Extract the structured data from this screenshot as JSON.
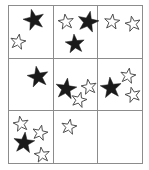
{
  "figure": {
    "grid": {
      "rows": 3,
      "columns": 3,
      "x": 8,
      "y": 5,
      "width": 134,
      "height": 158,
      "line_color": "#8c8c8c",
      "background_color": "#ffffff"
    },
    "star_styles": {
      "filled": {
        "name": "filled-star",
        "fill": "#1a1a1a",
        "stroke": "#1a1a1a"
      },
      "outline": {
        "name": "outline-star",
        "fill": "#ffffff",
        "stroke": "#4d4d4d"
      }
    },
    "cells": [
      {
        "row": 0,
        "col": 0,
        "name": "cell-r0-c0",
        "counts": {
          "filled": 1,
          "outline": 1,
          "total": 2
        },
        "stars": [
          {
            "type": "filled",
            "cx": 34,
            "cy": 20,
            "r": 11,
            "rot": -14
          },
          {
            "type": "outline",
            "cx": 18,
            "cy": 42,
            "r": 8,
            "rot": 10
          }
        ]
      },
      {
        "row": 0,
        "col": 1,
        "name": "cell-r0-c1",
        "counts": {
          "filled": 2,
          "outline": 1,
          "total": 3
        },
        "stars": [
          {
            "type": "outline",
            "cx": 66,
            "cy": 22,
            "r": 8,
            "rot": -8
          },
          {
            "type": "filled",
            "cx": 88,
            "cy": 22,
            "r": 11,
            "rot": 12
          },
          {
            "type": "filled",
            "cx": 75,
            "cy": 44,
            "r": 10,
            "rot": -6
          }
        ]
      },
      {
        "row": 0,
        "col": 2,
        "name": "cell-r0-c2",
        "counts": {
          "filled": 0,
          "outline": 2,
          "total": 2
        },
        "stars": [
          {
            "type": "outline",
            "cx": 112,
            "cy": 22,
            "r": 8,
            "rot": 6
          },
          {
            "type": "outline",
            "cx": 133,
            "cy": 24,
            "r": 8,
            "rot": -12
          }
        ]
      },
      {
        "row": 1,
        "col": 0,
        "name": "cell-r1-c0",
        "counts": {
          "filled": 1,
          "outline": 0,
          "total": 1
        },
        "stars": [
          {
            "type": "filled",
            "cx": 38,
            "cy": 77,
            "r": 11,
            "rot": -10
          }
        ]
      },
      {
        "row": 1,
        "col": 1,
        "name": "cell-r1-c1",
        "counts": {
          "filled": 1,
          "outline": 2,
          "total": 3
        },
        "stars": [
          {
            "type": "filled",
            "cx": 66,
            "cy": 89,
            "r": 11,
            "rot": 8
          },
          {
            "type": "outline",
            "cx": 89,
            "cy": 87,
            "r": 8,
            "rot": -10
          },
          {
            "type": "outline",
            "cx": 79,
            "cy": 100,
            "r": 8,
            "rot": 14
          }
        ]
      },
      {
        "row": 1,
        "col": 2,
        "name": "cell-r1-c2",
        "counts": {
          "filled": 1,
          "outline": 2,
          "total": 3
        },
        "stars": [
          {
            "type": "filled",
            "cx": 111,
            "cy": 88,
            "r": 11,
            "rot": -6
          },
          {
            "type": "outline",
            "cx": 128,
            "cy": 76,
            "r": 8,
            "rot": 10
          },
          {
            "type": "outline",
            "cx": 133,
            "cy": 95,
            "r": 8,
            "rot": -14
          }
        ]
      },
      {
        "row": 2,
        "col": 0,
        "name": "cell-r2-c0",
        "counts": {
          "filled": 1,
          "outline": 3,
          "total": 4
        },
        "stars": [
          {
            "type": "outline",
            "cx": 21,
            "cy": 124,
            "r": 8,
            "rot": -10
          },
          {
            "type": "outline",
            "cx": 40,
            "cy": 133,
            "r": 8,
            "rot": 12
          },
          {
            "type": "filled",
            "cx": 24,
            "cy": 143,
            "r": 11,
            "rot": 6
          },
          {
            "type": "outline",
            "cx": 42,
            "cy": 155,
            "r": 8,
            "rot": -8
          }
        ]
      },
      {
        "row": 2,
        "col": 1,
        "name": "cell-r2-c1",
        "counts": {
          "filled": 0,
          "outline": 1,
          "total": 1
        },
        "stars": [
          {
            "type": "outline",
            "cx": 69,
            "cy": 127,
            "r": 8,
            "rot": 10
          }
        ]
      },
      {
        "row": 2,
        "col": 2,
        "name": "cell-r2-c2",
        "counts": {
          "filled": 0,
          "outline": 0,
          "total": 0
        },
        "stars": []
      }
    ],
    "totals": {
      "filled": 7,
      "outline": 12,
      "total": 19
    }
  }
}
